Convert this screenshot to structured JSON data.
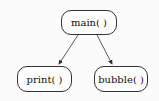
{
  "diagram": {
    "nodes": [
      {
        "id": "main",
        "label": "main( )"
      },
      {
        "id": "print",
        "label": "print( )"
      },
      {
        "id": "bubble",
        "label": "bubble( )"
      }
    ],
    "edges": [
      {
        "from": "main",
        "to": "print"
      },
      {
        "from": "main",
        "to": "bubble"
      }
    ],
    "colors": {
      "stroke": "#333333",
      "background": "#fbfbfb"
    }
  }
}
